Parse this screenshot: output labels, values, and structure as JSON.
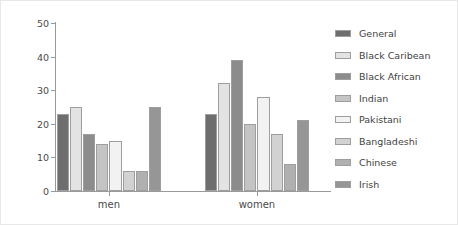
{
  "chart_data": {
    "type": "bar",
    "title": "",
    "xlabel": "",
    "ylabel": "% of obese individuals",
    "categories": [
      "men",
      "women"
    ],
    "ylim": [
      0,
      50
    ],
    "yticks": [
      0,
      10,
      20,
      30,
      40,
      50
    ],
    "grid": false,
    "legend_position": "right",
    "series": [
      {
        "name": "General",
        "values": [
          23,
          23
        ],
        "color": "#6e6e6e"
      },
      {
        "name": "Black Caribean",
        "values": [
          25,
          32
        ],
        "color": "#e3e3e3"
      },
      {
        "name": "Black African",
        "values": [
          17,
          39
        ],
        "color": "#8c8c8c"
      },
      {
        "name": "Indian",
        "values": [
          14,
          20
        ],
        "color": "#c4c4c4"
      },
      {
        "name": "Pakistani",
        "values": [
          15,
          28
        ],
        "color": "#f2f2f2"
      },
      {
        "name": "Bangladeshi",
        "values": [
          6,
          17
        ],
        "color": "#d2d2d2"
      },
      {
        "name": "Chinese",
        "values": [
          6,
          8
        ],
        "color": "#b0b0b0"
      },
      {
        "name": "Irish",
        "values": [
          25,
          21
        ],
        "color": "#969696"
      }
    ]
  },
  "axis": {
    "y_tick_labels": [
      "0",
      "10",
      "20",
      "30",
      "40",
      "50"
    ],
    "x_tick_labels": [
      "men",
      "women"
    ]
  }
}
